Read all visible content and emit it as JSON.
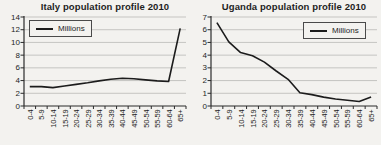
{
  "colors": {
    "background": "#f3f2ef",
    "grid": "#b9b9b6",
    "axis": "#2a2a2a",
    "text": "#1e1e1e",
    "line": "#1c1c1c"
  },
  "chart_data": [
    {
      "type": "line",
      "title": "Italy population profile 2010",
      "legend_label": "Millions",
      "legend_position": "top-left",
      "categories": [
        "0-4",
        "5-9",
        "10-14",
        "15-19",
        "20-24",
        "25-29",
        "30-34",
        "35-39",
        "40-44",
        "45-49",
        "50-54",
        "55-59",
        "60-64",
        "65+"
      ],
      "values": [
        3.05,
        3.05,
        2.9,
        3.15,
        3.4,
        3.65,
        3.95,
        4.2,
        4.35,
        4.3,
        4.1,
        3.95,
        3.85,
        12.2
      ],
      "xlabel": "",
      "ylabel": "",
      "ylim": [
        0,
        14
      ],
      "ytick_step": 2,
      "grid": true
    },
    {
      "type": "line",
      "title": "Uganda population profile 2010",
      "legend_label": "Millions",
      "legend_position": "top-right",
      "categories": [
        "0-4",
        "5-9",
        "10-14",
        "15-19",
        "20-24",
        "25-29",
        "30-34",
        "35-39",
        "40-44",
        "45-49",
        "50-54",
        "55-59",
        "60-64",
        "65+"
      ],
      "values": [
        6.55,
        5.05,
        4.2,
        3.95,
        3.45,
        2.75,
        2.1,
        1.05,
        0.9,
        0.7,
        0.55,
        0.45,
        0.35,
        0.7
      ],
      "xlabel": "",
      "ylabel": "",
      "ylim": [
        0,
        7
      ],
      "ytick_step": 1,
      "grid": true
    }
  ]
}
